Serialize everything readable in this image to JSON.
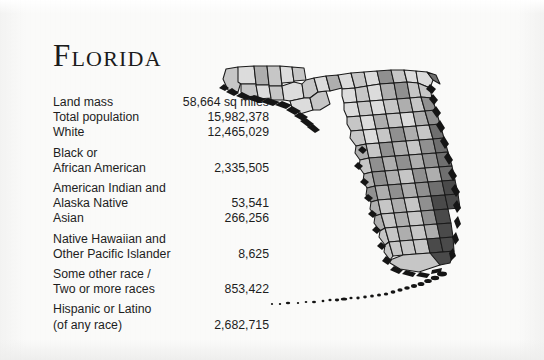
{
  "page": {
    "title": "Florida",
    "background_color": "#fafaf9",
    "text_color": "#1d1d1d"
  },
  "stats": {
    "rows": [
      {
        "label": "Land mass",
        "value": "58,664 sq miles",
        "lines": 1
      },
      {
        "label": "Total population",
        "value": "15,982,378",
        "lines": 1
      },
      {
        "label": "White",
        "value": "12,465,029",
        "lines": 1
      },
      {
        "label": "Black or\nAfrican American",
        "value": "2,335,505",
        "lines": 2
      },
      {
        "label": "American Indian and\nAlaska Native",
        "value": "53,541",
        "lines": 2
      },
      {
        "label": "Asian",
        "value": "266,256",
        "lines": 1
      },
      {
        "label": "Native Hawaiian and\nOther Pacific Islander",
        "value": "8,625",
        "lines": 2
      },
      {
        "label": "Some other race /\nTwo or more races",
        "value": "853,422",
        "lines": 2
      },
      {
        "label": "Hispanic or Latino\n(of any race)",
        "value": "2,682,715",
        "lines": 2
      }
    ]
  },
  "map": {
    "name": "florida-county-choropleth",
    "type": "choropleth",
    "region": "Florida",
    "subdivision": "counties",
    "palette": {
      "lightest": "#f2f2f2",
      "light": "#dcdcdc",
      "medium_light": "#c6c6c6",
      "medium": "#aeaeae",
      "medium_dark": "#909090",
      "dark": "#6f6f6f",
      "darkest": "#4a4a4a",
      "outline": "#1a1a1a"
    },
    "note": "Grayscale shading indicates relative county population; southeast coastal counties are darkest."
  }
}
